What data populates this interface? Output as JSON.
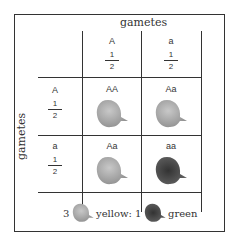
{
  "diagram": {
    "top_label": "gametes",
    "side_label": "gametes",
    "columns": [
      {
        "allele": "A",
        "num": "1",
        "den": "2"
      },
      {
        "allele": "a",
        "num": "1",
        "den": "2"
      }
    ],
    "rows": [
      {
        "allele": "A",
        "num": "1",
        "den": "2"
      },
      {
        "allele": "a",
        "num": "1",
        "den": "2"
      }
    ],
    "cells": [
      {
        "genotype": "AA",
        "phenotype": "yellow",
        "color": "#a8a8a8"
      },
      {
        "genotype": "Aa",
        "phenotype": "yellow",
        "color": "#a8a8a8"
      },
      {
        "genotype": "Aa",
        "phenotype": "yellow",
        "color": "#a8a8a8"
      },
      {
        "genotype": "aa",
        "phenotype": "green",
        "color": "#555555"
      }
    ],
    "legend": {
      "count_yellow": "3",
      "label_yellow": "yellow: 1",
      "label_green": "green"
    }
  }
}
